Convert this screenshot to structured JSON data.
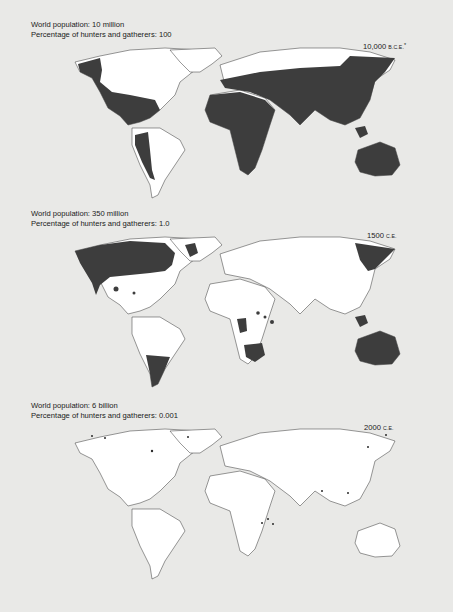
{
  "figure_title": "World population and percentage of hunters and gatherers over time",
  "colors": {
    "background": "#e9e9e7",
    "land": "#ffffff",
    "hunter_gatherer_area": "#3d3d3d",
    "coastline": "#333333"
  },
  "panels": [
    {
      "population_label": "World population: 10 million",
      "percentage_label": "Percentage of hunters and gatherers: 100",
      "era_number": "10,000",
      "era_suffix": "B.C.E.",
      "era_asterisk": "*",
      "population": "10 million",
      "percent_hunter_gatherers": 100
    },
    {
      "population_label": "World population: 350 million",
      "percentage_label": "Percentage of hunters and gatherers: 1.0",
      "era_number": "1500",
      "era_suffix": "C.E.",
      "era_asterisk": "",
      "population": "350 million",
      "percent_hunter_gatherers": 1.0
    },
    {
      "population_label": "World population: 6 billion",
      "percentage_label": "Percentage of hunters and gatherers: 0.001",
      "era_number": "2000",
      "era_suffix": "C.E.",
      "era_asterisk": "",
      "population": "6 billion",
      "percent_hunter_gatherers": 0.001
    }
  ]
}
